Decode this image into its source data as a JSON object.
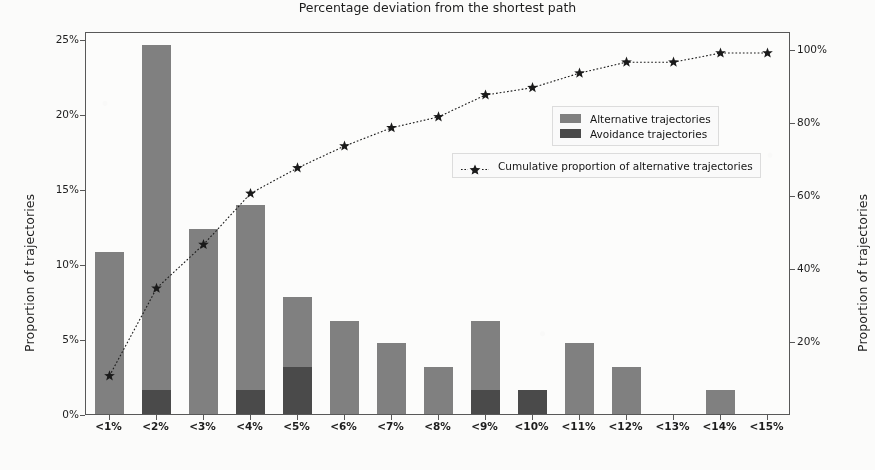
{
  "chart_data": {
    "type": "bar",
    "title": "",
    "xlabel": "Percentage deviation from the shortest path",
    "ylabel": "Proportion of trajectories",
    "ylabel_right": "Proportion of trajectories",
    "categories": [
      "<1%",
      "<2%",
      "<3%",
      "<4%",
      "<5%",
      "<6%",
      "<7%",
      "<8%",
      "<9%",
      "<10%",
      "<11%",
      "<12%",
      "<13%",
      "<14%",
      "<15%"
    ],
    "ylim": [
      0,
      25.5
    ],
    "ylim_right": [
      0,
      105
    ],
    "yticks": [
      "0%",
      "5%",
      "10%",
      "15%",
      "20%",
      "25%"
    ],
    "ytick_values": [
      0,
      5,
      10,
      15,
      20,
      25
    ],
    "yticks_right": [
      "20%",
      "40%",
      "60%",
      "80%",
      "100%"
    ],
    "ytick_values_right": [
      20,
      40,
      60,
      80,
      100
    ],
    "grid": false,
    "legend_position": "upper right",
    "series": [
      {
        "name": "Alternative trajectories",
        "type": "bar",
        "color": "#808080",
        "values": [
          10.8,
          24.6,
          12.3,
          13.9,
          7.8,
          6.2,
          4.7,
          3.1,
          6.2,
          1.6,
          4.7,
          3.1,
          0.0,
          1.6,
          0.0
        ]
      },
      {
        "name": "Avoidance trajectories",
        "type": "bar",
        "color": "#4a4a4a",
        "values": [
          0.0,
          1.6,
          0.0,
          1.6,
          3.1,
          0.0,
          0.0,
          0.0,
          1.6,
          1.6,
          0.0,
          0.0,
          0.0,
          0.0,
          0.0
        ]
      },
      {
        "name": "Cumulative proportion of alternative trajectories",
        "type": "line",
        "axis": "right",
        "color": "#1a1a1a",
        "marker": "star",
        "linestyle": "dotted",
        "values": [
          11,
          35,
          47,
          61,
          68,
          74,
          79,
          82,
          88,
          90,
          94,
          97,
          97,
          99.5,
          99.5
        ]
      }
    ]
  },
  "legend": {
    "bars": [
      {
        "label": "Alternative trajectories",
        "swatch": "sw-alt"
      },
      {
        "label": "Avoidance trajectories",
        "swatch": "sw-avoid"
      }
    ],
    "line": {
      "label": "Cumulative proportion of alternative trajectories"
    }
  },
  "colors": {
    "alternative": "#808080",
    "avoidance": "#4a4a4a",
    "line": "#1a1a1a",
    "axis": "#585858",
    "background": "#fbfbfa"
  }
}
